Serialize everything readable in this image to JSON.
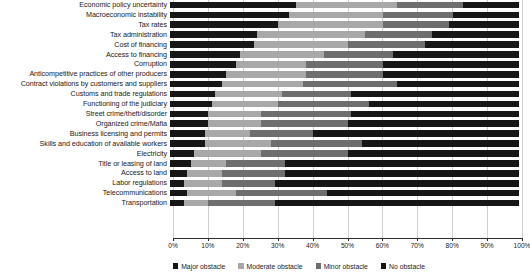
{
  "chart_data": {
    "type": "bar",
    "subtype": "stacked-horizontal-100",
    "title": "",
    "xlabel": "",
    "ylabel": "",
    "xlim": [
      0,
      100
    ],
    "grid": true,
    "legend_position": "bottom",
    "xtick_labels": [
      "0%",
      "10%",
      "20%",
      "30%",
      "40%",
      "50%",
      "60%",
      "70%",
      "80%",
      "90%",
      "100%"
    ],
    "xticks": [
      0,
      10,
      20,
      30,
      40,
      50,
      60,
      70,
      80,
      90,
      100
    ],
    "categories": [
      "Economic policy uncertainty",
      "Macroeconomic instability",
      "Tax rates",
      "Tax administration",
      "Cost of financing",
      "Access to financing",
      "Corruption",
      "Anticompetitive practices of other producers",
      "Contract violations by customers and suppliers",
      "Customs and trade regulations",
      "Functioning of the judiciary",
      "Street crime/theft/disorder",
      "Organized crime/Mafia",
      "Business licensing and permits",
      "Skills and education of available workers",
      "Electricity",
      "Title or leasing of land",
      "Access to land",
      "Labor regulations",
      "Telecommunications",
      "Transportation"
    ],
    "series": [
      {
        "name": "Major obstacle",
        "color": "#161616",
        "values": [
          36,
          34,
          31,
          25,
          24,
          20,
          19,
          16,
          15,
          13,
          12,
          11,
          11,
          10,
          10,
          7,
          6,
          5,
          4,
          5,
          4
        ]
      },
      {
        "name": "Moderate obstacle",
        "color": "#a8a8a8",
        "values": [
          29,
          27,
          30,
          31,
          27,
          24,
          20,
          23,
          23,
          19,
          19,
          15,
          15,
          13,
          19,
          19,
          10,
          10,
          11,
          14,
          7
        ]
      },
      {
        "name": "Minor obstacle",
        "color": "#6e6e6e",
        "values": [
          19,
          20,
          19,
          19,
          22,
          20,
          22,
          22,
          27,
          20,
          26,
          26,
          25,
          18,
          26,
          25,
          17,
          18,
          15,
          26,
          19
        ]
      },
      {
        "name": "No obstacle",
        "color": "#161616",
        "values": [
          16,
          19,
          20,
          25,
          27,
          36,
          39,
          39,
          35,
          48,
          43,
          48,
          49,
          59,
          45,
          49,
          67,
          67,
          70,
          55,
          70
        ]
      }
    ]
  },
  "legend": {
    "items": [
      {
        "label": "Major obstacle",
        "key": "major"
      },
      {
        "label": "Moderate obstacle",
        "key": "moderate"
      },
      {
        "label": "Minor obstacle",
        "key": "minor"
      },
      {
        "label": "No obstacle",
        "key": "none"
      }
    ]
  }
}
